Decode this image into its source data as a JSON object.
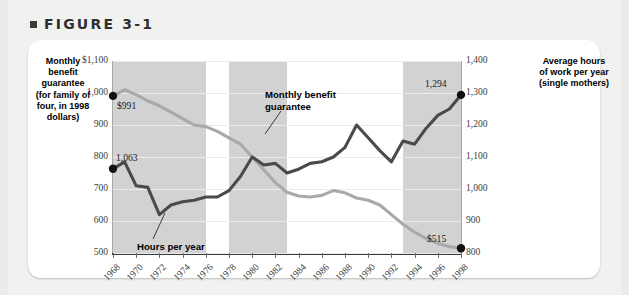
{
  "figure": {
    "bullet_icon": "square-bullet-icon",
    "title": "FIGURE 3-1"
  },
  "axis_captions": {
    "left": "Monthly benefit guarantee (for family of four, in 1998 dollars)",
    "right": "Average hours of work per year (single mothers)"
  },
  "chart_data": {
    "type": "line",
    "title": "FIGURE 3-1",
    "xlabel": "",
    "ylabel": "Monthly benefit guarantee (for family of four, in 1998 dollars)",
    "y2label": "Average hours of work per year (single mothers)",
    "ylim": [
      500,
      1100
    ],
    "y2lim": [
      800,
      1400
    ],
    "yticks": [
      "$1,100",
      "1,000",
      "900",
      "800",
      "700",
      "600",
      "500"
    ],
    "ytick_values": [
      1100,
      1000,
      900,
      800,
      700,
      600,
      500
    ],
    "y2ticks": [
      "1,400",
      "1,300",
      "1,200",
      "1,100",
      "1,000",
      "900",
      "800"
    ],
    "y2tick_values": [
      1400,
      1300,
      1200,
      1100,
      1000,
      900,
      800
    ],
    "xlim": [
      1968,
      1998
    ],
    "xticks": [
      "1968",
      "1970",
      "1972",
      "1974",
      "1976",
      "1978",
      "1980",
      "1982",
      "1984",
      "1986",
      "1988",
      "1990",
      "1992",
      "1994",
      "1996",
      "1998"
    ],
    "xtick_values": [
      1968,
      1970,
      1972,
      1974,
      1976,
      1978,
      1980,
      1982,
      1984,
      1986,
      1988,
      1990,
      1992,
      1994,
      1996,
      1998
    ],
    "grid": true,
    "legend": "inline-annotations",
    "x": [
      1968,
      1969,
      1970,
      1971,
      1972,
      1973,
      1974,
      1975,
      1976,
      1977,
      1978,
      1979,
      1980,
      1981,
      1982,
      1983,
      1984,
      1985,
      1986,
      1987,
      1988,
      1989,
      1990,
      1991,
      1992,
      1993,
      1994,
      1995,
      1996,
      1997,
      1998
    ],
    "series": [
      {
        "name": "Monthly benefit guarantee",
        "axis": "left",
        "units": "1998 dollars per month",
        "color": "#a9a9a9",
        "values": [
          991,
          1010,
          995,
          975,
          960,
          940,
          920,
          900,
          895,
          880,
          860,
          840,
          800,
          760,
          720,
          690,
          678,
          675,
          680,
          695,
          688,
          672,
          665,
          650,
          620,
          590,
          565,
          545,
          530,
          520,
          515
        ]
      },
      {
        "name": "Hours per year",
        "axis": "right",
        "units": "average hours of work per year",
        "color": "#4a4a4a",
        "values": [
          1063,
          1085,
          1010,
          1005,
          920,
          950,
          960,
          965,
          975,
          975,
          995,
          1040,
          1100,
          1075,
          1080,
          1050,
          1062,
          1080,
          1085,
          1100,
          1130,
          1200,
          1160,
          1120,
          1085,
          1150,
          1140,
          1190,
          1230,
          1250,
          1294
        ]
      }
    ],
    "point_labels": [
      {
        "text": "$991",
        "series": "Monthly benefit guarantee",
        "x": 1968,
        "value": 991
      },
      {
        "text": "$515",
        "series": "Monthly benefit guarantee",
        "x": 1998,
        "value": 515
      },
      {
        "text": "1,063",
        "series": "Hours per year",
        "x": 1968,
        "value": 1063
      },
      {
        "text": "1,294",
        "series": "Hours per year",
        "x": 1998,
        "value": 1294
      }
    ],
    "annotations": [
      {
        "text": "Monthly benefit\nguarantee",
        "target_series": "Monthly benefit guarantee"
      },
      {
        "text": "Hours per year",
        "target_series": "Hours per year"
      }
    ],
    "shaded_bands": [
      {
        "from": 1968,
        "to": 1976
      },
      {
        "from": 1978,
        "to": 1983
      },
      {
        "from": 1993,
        "to": 1998
      }
    ],
    "band_color": "#d2d2d2"
  }
}
